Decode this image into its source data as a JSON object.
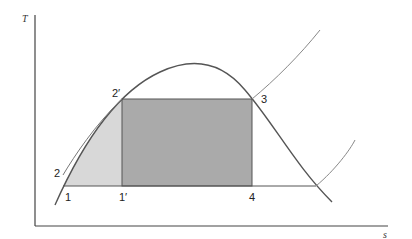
{
  "diagram": {
    "type": "T-s diagram (Carnot cycle within vapor dome)",
    "axes": {
      "y_label": "T",
      "x_label": "s"
    },
    "points": {
      "p1": "1",
      "p1prime": "1′",
      "p2": "2",
      "p2prime": "2′",
      "p3": "3",
      "p4": "4"
    },
    "colors": {
      "dark_fill": "#aaaaaa",
      "light_fill": "#d8d8d8",
      "curve": "#555555",
      "axis": "#444444",
      "background": "#ffffff"
    }
  }
}
